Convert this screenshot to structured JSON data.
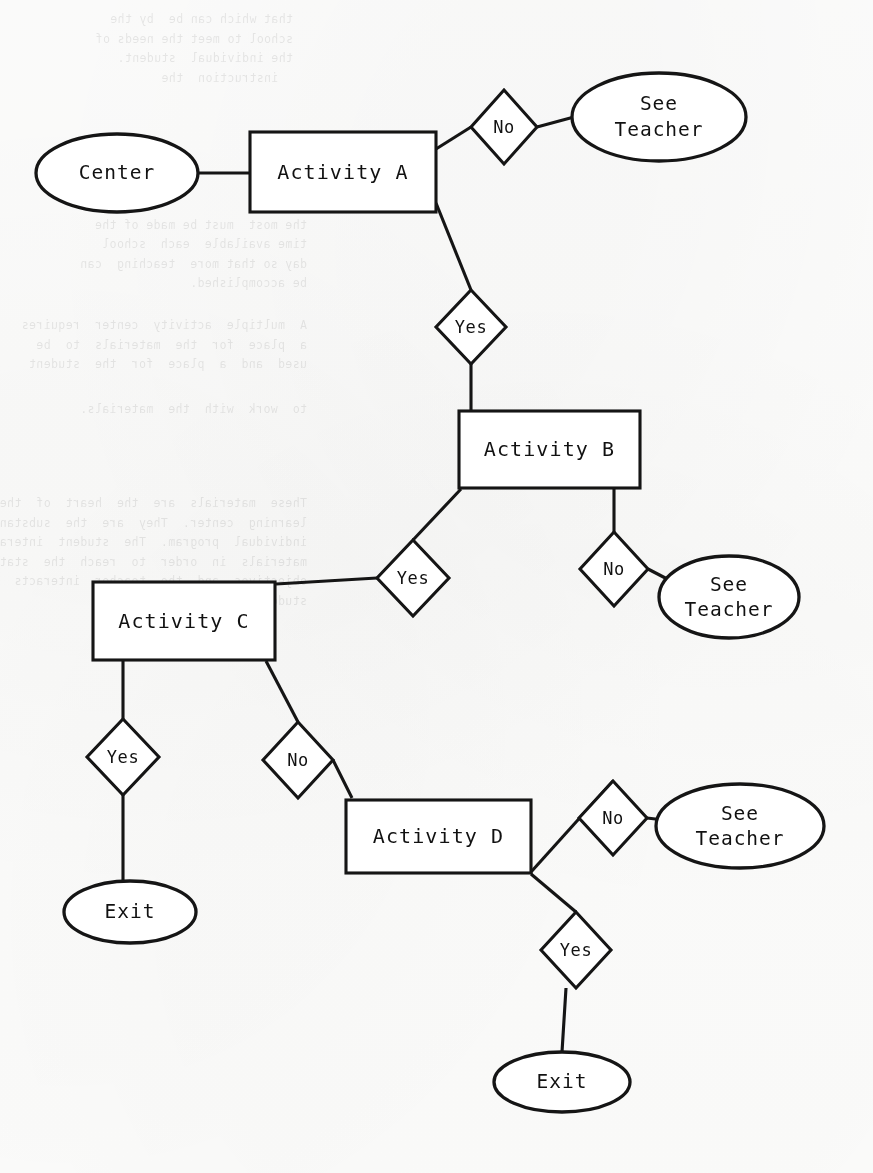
{
  "document": {
    "type": "flowchart",
    "title": "Learning Center Activity Flowchart",
    "background_note": "faint reverse-side typewriter bleed-through"
  },
  "nodes": {
    "center": {
      "id": "center",
      "shape": "ellipse",
      "label": "Center",
      "cx": 117,
      "cy": 173,
      "rx": 81,
      "ry": 39
    },
    "activity_a": {
      "id": "activity-a",
      "shape": "rect",
      "label": "Activity A",
      "x": 250,
      "y": 132,
      "w": 186,
      "h": 80
    },
    "activity_b": {
      "id": "activity-b",
      "shape": "rect",
      "label": "Activity B",
      "x": 459,
      "y": 411,
      "w": 181,
      "h": 77
    },
    "activity_c": {
      "id": "activity-c",
      "shape": "rect",
      "label": "Activity C",
      "x": 93,
      "y": 582,
      "w": 182,
      "h": 78
    },
    "activity_d": {
      "id": "activity-d",
      "shape": "rect",
      "label": "Activity D",
      "x": 346,
      "y": 800,
      "w": 185,
      "h": 73
    },
    "see_teacher_1": {
      "id": "see-teacher-1",
      "shape": "ellipse",
      "label_line1": "See",
      "label_line2": "Teacher",
      "cx": 659,
      "cy": 117,
      "rx": 87,
      "ry": 44
    },
    "see_teacher_2": {
      "id": "see-teacher-2",
      "shape": "ellipse",
      "label_line1": "See",
      "label_line2": "Teacher",
      "cx": 729,
      "cy": 597,
      "rx": 70,
      "ry": 41
    },
    "see_teacher_3": {
      "id": "see-teacher-3",
      "shape": "ellipse",
      "label_line1": "See",
      "label_line2": "Teacher",
      "cx": 740,
      "cy": 826,
      "rx": 84,
      "ry": 42
    },
    "exit_1": {
      "id": "exit-1",
      "shape": "ellipse",
      "label": "Exit",
      "cx": 130,
      "cy": 912,
      "rx": 66,
      "ry": 31
    },
    "exit_2": {
      "id": "exit-2",
      "shape": "ellipse",
      "label": "Exit",
      "cx": 562,
      "cy": 1082,
      "rx": 68,
      "ry": 30
    }
  },
  "decisions": [
    {
      "id": "decision-a-no",
      "label": "No",
      "cx": 504,
      "cy": 127,
      "rx": 33,
      "ry": 37,
      "from": "activity-a",
      "to": "see-teacher-1"
    },
    {
      "id": "decision-a-yes",
      "label": "Yes",
      "cx": 471,
      "cy": 327,
      "rx": 35,
      "ry": 37,
      "from": "activity-a",
      "to": "activity-b"
    },
    {
      "id": "decision-b-yes",
      "label": "Yes",
      "cx": 413,
      "cy": 578,
      "rx": 36,
      "ry": 38,
      "from": "activity-b",
      "to": "activity-c"
    },
    {
      "id": "decision-b-no",
      "label": "No",
      "cx": 614,
      "cy": 569,
      "rx": 34,
      "ry": 37,
      "from": "activity-b",
      "to": "see-teacher-2"
    },
    {
      "id": "decision-c-yes",
      "label": "Yes",
      "cx": 123,
      "cy": 757,
      "rx": 36,
      "ry": 38,
      "from": "activity-c",
      "to": "exit-1"
    },
    {
      "id": "decision-c-no",
      "label": "No",
      "cx": 298,
      "cy": 760,
      "rx": 35,
      "ry": 38,
      "from": "activity-c",
      "to": "activity-d"
    },
    {
      "id": "decision-d-no",
      "label": "No",
      "cx": 613,
      "cy": 818,
      "rx": 34,
      "ry": 37,
      "from": "activity-d",
      "to": "see-teacher-3"
    },
    {
      "id": "decision-d-yes",
      "label": "Yes",
      "cx": 576,
      "cy": 950,
      "rx": 35,
      "ry": 38,
      "from": "activity-d",
      "to": "exit-2"
    }
  ],
  "edges": [
    {
      "id": "edge-center-a",
      "d": "M 198 173 L 250 173"
    },
    {
      "id": "edge-a-no-in",
      "d": "M 436 149 L 471 127"
    },
    {
      "id": "edge-a-no-out",
      "d": "M 537 127 L 574 117"
    },
    {
      "id": "edge-a-yes-in",
      "d": "M 436 203 L 471 290"
    },
    {
      "id": "edge-a-yes-out",
      "d": "M 471 364 L 471 411"
    },
    {
      "id": "edge-b-yes-in",
      "d": "M 461 489 L 413 540"
    },
    {
      "id": "edge-b-yes-out",
      "d": "M 377 578 L 276 584"
    },
    {
      "id": "edge-b-no-in",
      "d": "M 614 489 L 614 532"
    },
    {
      "id": "edge-b-no-out",
      "d": "M 648 569 L 673 582"
    },
    {
      "id": "edge-c-yes-in",
      "d": "M 123 661 L 123 719"
    },
    {
      "id": "edge-c-yes-out",
      "d": "M 123 795 L 123 882"
    },
    {
      "id": "edge-c-no-in",
      "d": "M 266 661 L 298 722"
    },
    {
      "id": "edge-c-no-out",
      "d": "M 333 760 L 352 798"
    },
    {
      "id": "edge-d-no-in",
      "d": "M 531 872 L 613 781"
    },
    {
      "id": "edge-d-no-out",
      "d": "M 647 818 L 672 821"
    },
    {
      "id": "edge-d-yes-in",
      "d": "M 531 874 L 576 912"
    },
    {
      "id": "edge-d-yes-out",
      "d": "M 566 988 L 562 1052"
    }
  ],
  "bleed_text": {
    "note": "illegible reverse-side typewritten text visible through the page",
    "blocks": [
      {
        "x": 580,
        "y": 10,
        "lines": [
          "that which can be  by the",
          "school to meet the needs of",
          "the individual  student.",
          "  instruction  the"
        ]
      },
      {
        "x": 566,
        "y": 196,
        "lines": [
          "Second,",
          "the most  must be made of the",
          "time available  each  school",
          "day so that more  teaching  can",
          "be accomplished."
        ]
      },
      {
        "x": 566,
        "y": 316,
        "lines": [
          "A  multiple  activity  center  requires",
          "a  place  for  the  materials  to  be",
          "used  and  a  place  for  the  student"
        ]
      },
      {
        "x": 566,
        "y": 400,
        "lines": [
          "to  work  with  the  materials."
        ]
      },
      {
        "x": 566,
        "y": 494,
        "lines": [
          "These  materials  are  the  heart  of  the",
          "learning  center.  They  are  the  substance  of  the",
          "individual  program.  The  student  interacts  with  the",
          "materials  in  order  to  reach  the  stated",
          "objectives  and  the  teacher  interacts  with  the",
          "student  and  the  system."
        ]
      }
    ]
  },
  "colors": {
    "ink": "#151515",
    "paper": "#fdfdfc",
    "text": "#111111"
  }
}
